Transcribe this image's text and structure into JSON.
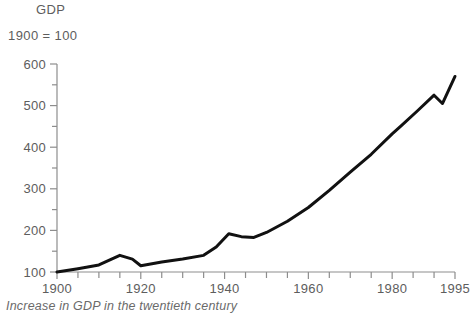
{
  "header": {
    "cropped_title": "",
    "axis_title": "GDP",
    "axis_subtitle": "1900 = 100"
  },
  "caption": "Increase in GDP in the twentieth century",
  "colors": {
    "line": "#111111",
    "axis": "#8d8d8d",
    "label": "#5d5d5d",
    "caption": "#6a6a6a",
    "background": "#ffffff"
  },
  "chart_data": {
    "type": "line",
    "title": "GDP",
    "subtitle": "1900 = 100",
    "caption": "Increase in GDP in the twentieth century",
    "xlabel": "",
    "ylabel": "GDP",
    "xlim": [
      1900,
      1995
    ],
    "ylim": [
      100,
      600
    ],
    "grid": false,
    "legend": "none",
    "y_ticks_major": [
      100,
      200,
      300,
      400,
      500,
      600
    ],
    "y_ticks_minor": [
      150,
      250,
      350,
      450,
      550
    ],
    "y_tick_labels": [
      "100",
      "200",
      "300",
      "400",
      "500",
      "600"
    ],
    "x_ticks_major": [
      1900,
      1920,
      1940,
      1960,
      1980,
      1995
    ],
    "x_tick_labels": [
      "1900",
      "1920",
      "1940",
      "1960",
      "1980",
      "1995"
    ],
    "x_ticks_minor": [
      1905,
      1910,
      1915,
      1925,
      1930,
      1935,
      1945,
      1950,
      1955,
      1965,
      1970,
      1975,
      1985,
      1990
    ],
    "series": [
      {
        "name": "GDP index (1900 = 100)",
        "x": [
          1900,
          1905,
          1910,
          1915,
          1918,
          1920,
          1925,
          1930,
          1935,
          1938,
          1941,
          1944,
          1947,
          1950,
          1955,
          1960,
          1965,
          1970,
          1975,
          1980,
          1982,
          1986,
          1990,
          1992,
          1995
        ],
        "values": [
          100,
          108,
          117,
          140,
          131,
          115,
          124,
          131,
          140,
          160,
          192,
          185,
          183,
          195,
          222,
          255,
          296,
          340,
          383,
          432,
          450,
          487,
          525,
          505,
          570
        ]
      }
    ]
  }
}
